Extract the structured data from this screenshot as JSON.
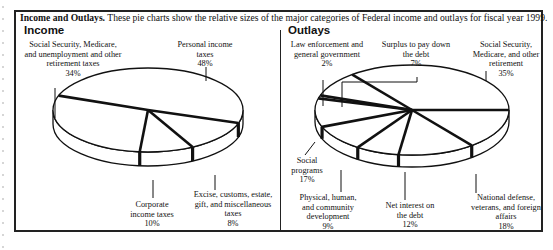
{
  "caption": {
    "bold": "Income and Outlays.",
    "text": "These pie charts show the  relative sizes of the major categories of Federal income and outlays for fiscal year 1999."
  },
  "income": {
    "title": "Income",
    "labels": [
      {
        "lines": [
          "Social Security, Medicare,",
          "and unemployment and other",
          "retirement taxes"
        ],
        "pct": "34%"
      },
      {
        "lines": [
          "Personal income",
          "taxes"
        ],
        "pct": "48%"
      },
      {
        "lines": [
          "Excise, customs, estate,",
          "gift, and miscellaneous",
          "taxes"
        ],
        "pct": "8%"
      },
      {
        "lines": [
          "Corporate",
          "income taxes"
        ],
        "pct": "10%"
      }
    ]
  },
  "outlays": {
    "title": "Outlays",
    "labels": [
      {
        "lines": [
          "Law enforcement and",
          "general government"
        ],
        "pct": "2%"
      },
      {
        "lines": [
          "Surplus to pay down",
          "the debt"
        ],
        "pct": "7%"
      },
      {
        "lines": [
          "Social Security,",
          "Medicare, and other",
          "retirement"
        ],
        "pct": "35%"
      },
      {
        "lines": [
          "National defense,",
          "veterans, and foreign",
          "affairs"
        ],
        "pct": "18%"
      },
      {
        "lines": [
          "Net interest on",
          "the debt"
        ],
        "pct": "12%"
      },
      {
        "lines": [
          "Physical, human,",
          "and community",
          "development"
        ],
        "pct": "9%"
      },
      {
        "lines": [
          "Social",
          "programs"
        ],
        "pct": "17%"
      }
    ]
  },
  "chart_data": [
    {
      "type": "pie",
      "title": "Income",
      "categories": [
        "Personal income taxes",
        "Social Security, Medicare, and unemployment and other retirement taxes",
        "Corporate income taxes",
        "Excise, customs, estate, gift, and miscellaneous taxes"
      ],
      "values": [
        48,
        34,
        10,
        8
      ],
      "unit": "%",
      "fiscal_year": "1999"
    },
    {
      "type": "pie",
      "title": "Outlays",
      "categories": [
        "Social Security, Medicare, and other retirement",
        "National defense, veterans, and foreign affairs",
        "Net interest on the debt",
        "Physical, human, and community development",
        "Social programs",
        "Law enforcement and general government",
        "Surplus to pay down the debt"
      ],
      "values": [
        35,
        18,
        12,
        9,
        17,
        2,
        7
      ],
      "unit": "%",
      "fiscal_year": "1999"
    }
  ]
}
